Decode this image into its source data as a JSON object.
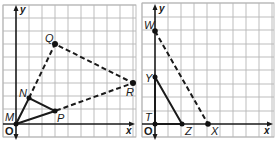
{
  "figure": {
    "graphs": [
      {
        "id": "left",
        "axes": {
          "x_label": "x",
          "y_label": "y",
          "origin_label": "O"
        },
        "grid": {
          "x_min": -1,
          "x_max": 9,
          "y_min": -1,
          "y_max": 9
        },
        "points": [
          {
            "name": "M",
            "x": 0,
            "y": 0
          },
          {
            "name": "N",
            "x": 1,
            "y": 2
          },
          {
            "name": "P",
            "x": 3,
            "y": 1
          },
          {
            "name": "Q",
            "x": 3,
            "y": 6
          },
          {
            "name": "R",
            "x": 9,
            "y": 3
          }
        ],
        "solid_segments": [
          [
            "M",
            "N"
          ],
          [
            "N",
            "P"
          ],
          [
            "P",
            "M"
          ]
        ],
        "dashed_segments": [
          [
            "N",
            "Q"
          ],
          [
            "Q",
            "R"
          ],
          [
            "R",
            "P"
          ]
        ],
        "scale_factor": 3
      },
      {
        "id": "right",
        "axes": {
          "x_label": "x",
          "y_label": "y",
          "origin_label": "O"
        },
        "grid": {
          "x_min": -1,
          "x_max": 9,
          "y_min": -1,
          "y_max": 9
        },
        "points": [
          {
            "name": "T",
            "x": 0,
            "y": 0
          },
          {
            "name": "Y",
            "x": 0,
            "y": 3.5
          },
          {
            "name": "Z",
            "x": 2,
            "y": 0
          },
          {
            "name": "W",
            "x": 0,
            "y": 7
          },
          {
            "name": "X",
            "x": 4,
            "y": 0
          }
        ],
        "solid_segments": [
          [
            "T",
            "Y"
          ],
          [
            "Y",
            "Z"
          ],
          [
            "Z",
            "T"
          ]
        ],
        "dashed_segments": [
          [
            "W",
            "X"
          ]
        ],
        "scale_factor": 2
      }
    ]
  },
  "labels": {
    "left": {
      "y": "y",
      "x": "x",
      "O": "O",
      "M": "M",
      "N": "N",
      "P": "P",
      "Q": "Q",
      "R": "R"
    },
    "right": {
      "y": "y",
      "x": "x",
      "O": "O",
      "T": "T",
      "Y": "Y",
      "Z": "Z",
      "W": "W",
      "X": "X"
    }
  }
}
